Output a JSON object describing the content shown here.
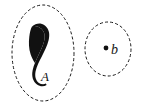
{
  "figure": {
    "background_color": "#ffffff",
    "stroke_color": "#1a1a1a",
    "fill_color": "#111111",
    "regions": [
      {
        "name": "region-A",
        "label": "A",
        "boundary_style": "dashed",
        "boundary_shape": "ellipse",
        "center_x": 43,
        "center_y": 53,
        "radius_x": 31,
        "radius_y": 48,
        "contents": "filled curved blob",
        "label_x": 41,
        "label_y": 80
      },
      {
        "name": "region-b",
        "label": "b",
        "boundary_style": "dashed",
        "boundary_shape": "circle",
        "center_x": 108,
        "center_y": 49,
        "radius_x": 23,
        "radius_y": 27,
        "contents": "single point",
        "label_x": 113,
        "label_y": 54,
        "point_x": 106,
        "point_y": 48,
        "point_radius": 2.4
      }
    ],
    "dash_pattern": "3,2.2",
    "stroke_width": 1.0,
    "label_font_size": 13
  }
}
